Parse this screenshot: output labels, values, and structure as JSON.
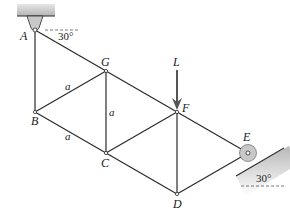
{
  "diagram": {
    "type": "truss",
    "joints": [
      {
        "id": "A",
        "label": "A",
        "x": 35,
        "y": 30
      },
      {
        "id": "G",
        "label": "G",
        "x": 106,
        "y": 71
      },
      {
        "id": "F",
        "label": "F",
        "x": 177,
        "y": 112
      },
      {
        "id": "E",
        "label": "E",
        "x": 248,
        "y": 153
      },
      {
        "id": "B",
        "label": "B",
        "x": 35,
        "y": 112
      },
      {
        "id": "C",
        "label": "C",
        "x": 106,
        "y": 153
      },
      {
        "id": "D",
        "label": "D",
        "x": 177,
        "y": 194
      }
    ],
    "members": [
      [
        "A",
        "G"
      ],
      [
        "G",
        "F"
      ],
      [
        "F",
        "E"
      ],
      [
        "A",
        "B"
      ],
      [
        "B",
        "G"
      ],
      [
        "B",
        "C"
      ],
      [
        "G",
        "C"
      ],
      [
        "C",
        "F"
      ],
      [
        "C",
        "D"
      ],
      [
        "F",
        "D"
      ],
      [
        "D",
        "E"
      ]
    ],
    "dimension_labels": {
      "bg": "a",
      "gc": "a",
      "bc": "a"
    },
    "load": {
      "label": "L",
      "at": "F",
      "direction": "down"
    },
    "supports": {
      "A": {
        "type": "pin",
        "angle_label": "30°"
      },
      "E": {
        "type": "roller",
        "angle_label": "30°"
      }
    },
    "colors": {
      "line": "#2a2a2a",
      "support_fill": "#c8c8c8",
      "load_arrow": "#555555"
    }
  }
}
